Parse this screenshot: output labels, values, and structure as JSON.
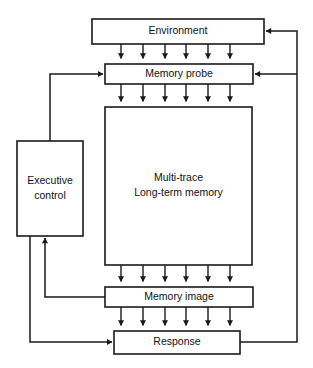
{
  "diagram": {
    "canvas": {
      "width": 313,
      "height": 368
    },
    "stroke_color": "#1a1a1a",
    "fill_color": "#ffffff",
    "text_color": "#111111",
    "nodes": [
      {
        "id": "environment",
        "label": "Environment",
        "x": 92,
        "y": 19,
        "w": 172,
        "h": 25,
        "lines": [
          "Environment"
        ]
      },
      {
        "id": "memory-probe",
        "label": "Memory probe",
        "x": 105,
        "y": 64,
        "w": 148,
        "h": 20,
        "lines": [
          "Memory probe"
        ]
      },
      {
        "id": "long-term-memory",
        "label": "Multi-trace Long-term memory",
        "x": 105,
        "y": 107,
        "w": 147,
        "h": 158,
        "lines": [
          "Multi-trace",
          "Long-term memory"
        ]
      },
      {
        "id": "executive-control",
        "label": "Executive control",
        "x": 17,
        "y": 141,
        "w": 66,
        "h": 95,
        "lines": [
          "Executive",
          "control"
        ]
      },
      {
        "id": "memory-image",
        "label": "Memory image",
        "x": 105,
        "y": 287,
        "w": 148,
        "h": 20,
        "lines": [
          "Memory image"
        ]
      },
      {
        "id": "response",
        "label": "Response",
        "x": 114,
        "y": 331,
        "w": 126,
        "h": 23,
        "lines": [
          "Response"
        ]
      }
    ],
    "bus_arrow_columns": [
      121,
      143,
      165,
      186,
      208,
      230
    ],
    "bus_groups": [
      {
        "id": "environment-to-memory-probe",
        "from": "environment",
        "to": "memory-probe",
        "y_start": 44,
        "y_end": 64
      },
      {
        "id": "memory-probe-to-long-term-memory",
        "from": "memory-probe",
        "to": "long-term-memory",
        "y_start": 84,
        "y_end": 107
      },
      {
        "id": "long-term-memory-to-memory-image",
        "from": "long-term-memory",
        "to": "memory-image",
        "y_start": 265,
        "y_end": 287
      },
      {
        "id": "memory-image-to-response",
        "from": "memory-image",
        "to": "response",
        "y_start": 307,
        "y_end": 331
      }
    ],
    "routed_edges": [
      {
        "id": "executive-control-to-memory-probe",
        "from": "executive-control",
        "to": "memory-probe",
        "points": "50,141 50,74 103,74",
        "arrow_at": "103,74",
        "arrow_dir": "right"
      },
      {
        "id": "memory-image-to-executive-control",
        "from": "memory-image",
        "to": "executive-control",
        "points": "105,297 45,297 45,238",
        "arrow_at": "45,238",
        "arrow_dir": "up"
      },
      {
        "id": "executive-control-to-response",
        "from": "executive-control",
        "to": "response",
        "points": "30,236 30,342 112,342",
        "arrow_at": "112,342",
        "arrow_dir": "right"
      },
      {
        "id": "response-to-environment",
        "from": "response",
        "to": "environment",
        "points": "240,342 297,342 297,31 266,31",
        "arrow_at": "266,31",
        "arrow_dir": "left"
      },
      {
        "id": "response-to-memory-probe",
        "from": "response",
        "to": "memory-probe",
        "points": "297,74 255,74",
        "arrow_at": "255,74",
        "arrow_dir": "left"
      }
    ]
  }
}
